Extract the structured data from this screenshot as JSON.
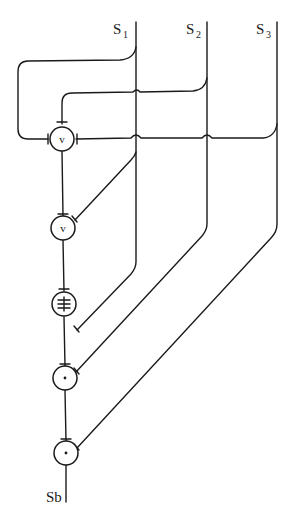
{
  "diagram": {
    "type": "signal-combination-network",
    "inputs": [
      {
        "id": "S1",
        "label": "S",
        "subscript": "1"
      },
      {
        "id": "S2",
        "label": "S",
        "subscript": "2"
      },
      {
        "id": "S3",
        "label": "S",
        "subscript": "3"
      }
    ],
    "output": {
      "id": "Sb",
      "label": "Sb"
    },
    "nodes": [
      {
        "id": "n1",
        "symbol": "v",
        "operation": "or",
        "inputs": [
          "S1",
          "S2",
          "S3"
        ]
      },
      {
        "id": "n2",
        "symbol": "v",
        "operation": "or",
        "inputs": [
          "n1",
          "S1"
        ]
      },
      {
        "id": "n3",
        "symbol": "≢",
        "operation": "xor-like",
        "inputs": [
          "n2",
          "S1"
        ]
      },
      {
        "id": "n4",
        "symbol": "·",
        "operation": "and",
        "inputs": [
          "n3",
          "S2"
        ]
      },
      {
        "id": "n5",
        "symbol": "·",
        "operation": "and",
        "inputs": [
          "n4",
          "S3"
        ]
      }
    ],
    "colors": {
      "stroke": "#1a1a1a",
      "background": "#ffffff"
    }
  }
}
